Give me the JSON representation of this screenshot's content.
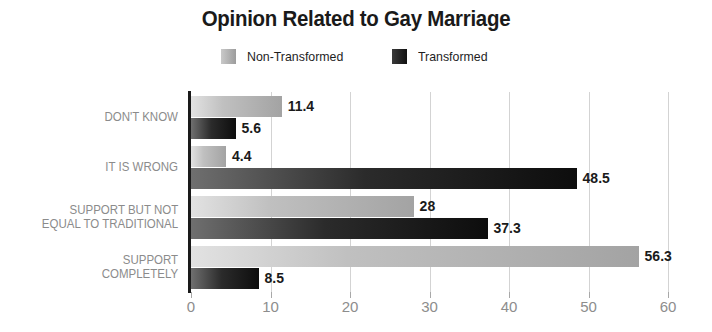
{
  "chart_data": {
    "type": "bar",
    "orientation": "horizontal",
    "title": "Opinion Related to Gay Marriage",
    "xlabel": "",
    "ylabel": "",
    "xlim": [
      0,
      60
    ],
    "xticks": [
      "0",
      "10",
      "20",
      "30",
      "40",
      "50",
      "60"
    ],
    "grid": true,
    "legend_position": "top-center",
    "categories": [
      "DON'T KNOW",
      "IT IS WRONG",
      "SUPPORT BUT NOT\nEQUAL TO TRADITIONAL",
      "SUPPORT\nCOMPLETELY"
    ],
    "series": [
      {
        "name": "Non-Transformed",
        "color": "#b4b4b4",
        "values": [
          11.4,
          4.4,
          28,
          56.3
        ],
        "value_labels": [
          "11.4",
          "4.4",
          "28",
          "56.3"
        ]
      },
      {
        "name": "Transformed",
        "color": "#141414",
        "values": [
          5.6,
          48.5,
          37.3,
          8.5
        ],
        "value_labels": [
          "5.6",
          "48.5",
          "37.3",
          "8.5"
        ]
      }
    ]
  },
  "legend": {
    "items": [
      {
        "label": "Non-Transformed",
        "swatch": "nt"
      },
      {
        "label": "Transformed",
        "swatch": "tr"
      }
    ]
  },
  "colors": {
    "axis": "#1a1a1a",
    "grid": "#d3d3d3",
    "tick_text": "#8d8d8d",
    "category_text": "#8b8b8b",
    "value_text": "#1a1a1a",
    "background": "#ffffff"
  }
}
